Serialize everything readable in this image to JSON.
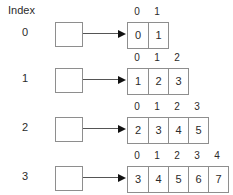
{
  "diagram": {
    "title": "Index",
    "type": "jagged-array",
    "colors": {
      "background": "#ffffff",
      "text": "#2b2b2b",
      "box_border": "#8e8e8e",
      "arrow": "#555555",
      "arrow_head": "#111111"
    },
    "rows": [
      {
        "index_label": "0",
        "column_headers": [
          "0",
          "1"
        ],
        "values": [
          "0",
          "1"
        ]
      },
      {
        "index_label": "1",
        "column_headers": [
          "0",
          "1",
          "2"
        ],
        "values": [
          "1",
          "2",
          "3"
        ]
      },
      {
        "index_label": "2",
        "column_headers": [
          "0",
          "1",
          "2",
          "3"
        ],
        "values": [
          "2",
          "3",
          "4",
          "5"
        ]
      },
      {
        "index_label": "3",
        "column_headers": [
          "0",
          "1",
          "2",
          "3",
          "4"
        ],
        "values": [
          "3",
          "4",
          "5",
          "6",
          "7"
        ]
      }
    ]
  }
}
